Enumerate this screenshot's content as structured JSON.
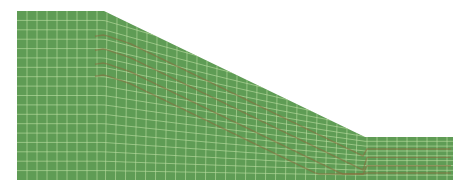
{
  "figure": {
    "type": "finite-element slope mesh",
    "colors": {
      "background": "#ffffff",
      "mesh_fill": "#5f9c55",
      "grid_line": "#b9dca0",
      "deformation_band": "#8a6a3c"
    },
    "geometry": {
      "left_x": 17,
      "right_x": 453,
      "top_y": 11,
      "bottom_y": 180,
      "crest_x": 104,
      "toe_x": 365,
      "toe_y": 137
    },
    "grid": {
      "column_width": 10,
      "row_height": 9.4
    }
  }
}
